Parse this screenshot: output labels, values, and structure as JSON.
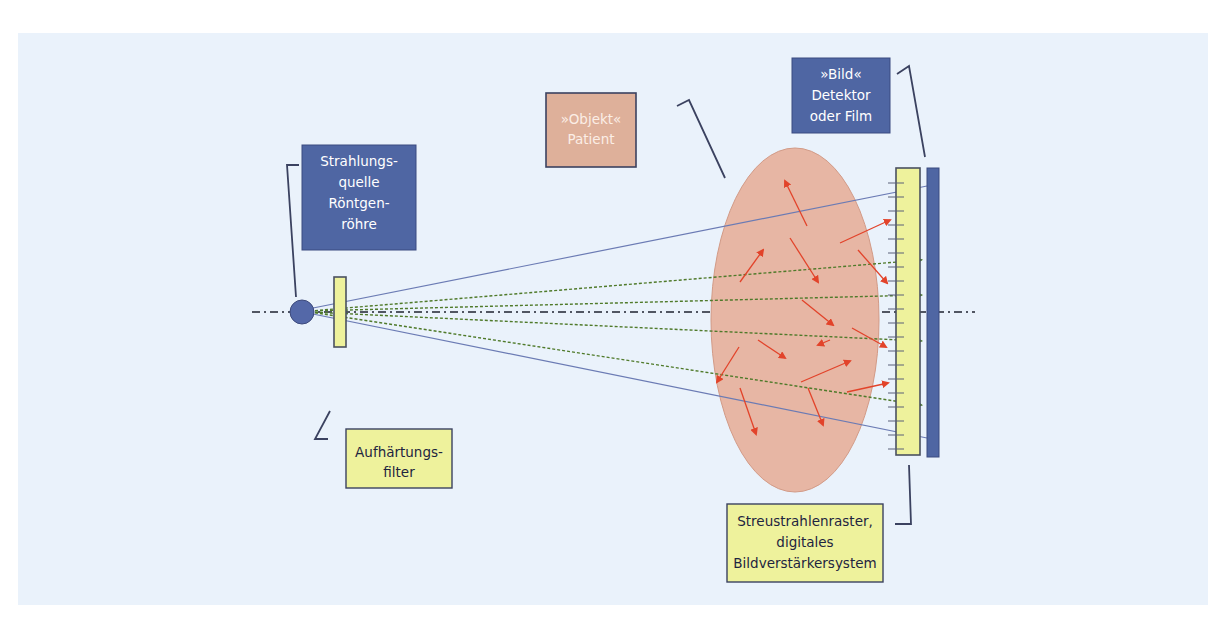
{
  "colors": {
    "panel_bg": "#eaf2fb",
    "blue_box": "#4f66a3",
    "yellow_box": "#eef29c",
    "peach_box": "#deb09a",
    "object_fill": "#e7b6a4",
    "box_border": "#3b4260",
    "direct_ray": "#6b7bb4",
    "primary_ray": "#4f7a2a",
    "scatter_arrow": "#e2432a",
    "axis": "#1f2330"
  },
  "labels": {
    "source": {
      "lines": [
        "Strahlungs-",
        "quelle",
        "Röntgen-",
        "röhre"
      ]
    },
    "filter": {
      "lines": [
        "Aufhärtungs-",
        "filter"
      ]
    },
    "object": {
      "lines": [
        "»Objekt«",
        "Patient"
      ]
    },
    "detector": {
      "lines": [
        "»Bild«",
        "Detektor",
        "oder Film"
      ]
    },
    "grid": {
      "lines": [
        "Streustrahlenraster,",
        "digitales",
        "Bildverstärkersystem"
      ]
    }
  },
  "components": [
    {
      "id": "source",
      "name": "X-ray tube (focal spot)",
      "shape": "circle"
    },
    {
      "id": "filter",
      "name": "Hardening filter",
      "shape": "bar"
    },
    {
      "id": "object",
      "name": "Patient object",
      "shape": "ellipse"
    },
    {
      "id": "grid",
      "name": "Anti-scatter grid",
      "shape": "bar-with-ticks"
    },
    {
      "id": "detector",
      "name": "Image detector / film",
      "shape": "bar"
    }
  ],
  "rays": {
    "direct_count": 2,
    "primary_count": 5,
    "scatter_arrow_count": 16
  }
}
